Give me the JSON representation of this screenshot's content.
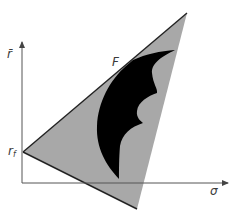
{
  "diagram": {
    "axes": {
      "y_label": "r̄",
      "x_label": "σ"
    },
    "points": {
      "tangency_label": "F",
      "intercept_label": "r",
      "intercept_subscript": "f"
    },
    "colors": {
      "triangle_fill": "#a8a8a8",
      "region_fill": "#000000",
      "axis": "#555555",
      "edge": "#222222"
    }
  }
}
